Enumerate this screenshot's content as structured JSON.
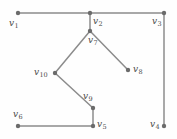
{
  "figure": {
    "type": "undirected-graph-diagram",
    "background_color": "#fefefe",
    "edge_color": "#8c8c8c",
    "vertex_color": "#6b6b6b",
    "label_color": "#4a4a4a",
    "width": 177,
    "height": 139
  },
  "vertices": [
    {
      "id": "v1",
      "label": "v",
      "sub": "1",
      "x": 18,
      "y": 13,
      "label_x": 9,
      "label_y": 19,
      "r": 2.2
    },
    {
      "id": "v2",
      "label": "v",
      "sub": "2",
      "x": 90,
      "y": 13,
      "label_x": 93,
      "label_y": 17,
      "r": 2.2
    },
    {
      "id": "v3",
      "label": "v",
      "sub": "3",
      "x": 164,
      "y": 13,
      "label_x": 152,
      "label_y": 17,
      "r": 2.2
    },
    {
      "id": "v4",
      "label": "v",
      "sub": "4",
      "x": 164,
      "y": 126,
      "label_x": 150,
      "label_y": 120,
      "r": 2.2
    },
    {
      "id": "v5",
      "label": "v",
      "sub": "5",
      "x": 93,
      "y": 126,
      "label_x": 97,
      "label_y": 120,
      "r": 2.2
    },
    {
      "id": "v6",
      "label": "v",
      "sub": "6",
      "x": 18,
      "y": 126,
      "label_x": 13,
      "label_y": 110,
      "r": 2.2
    },
    {
      "id": "v7",
      "label": "v",
      "sub": "7",
      "x": 90,
      "y": 31,
      "label_x": 88,
      "label_y": 36,
      "r": 2.2
    },
    {
      "id": "v8",
      "label": "v",
      "sub": "8",
      "x": 128,
      "y": 70,
      "label_x": 133,
      "label_y": 65,
      "r": 2.2
    },
    {
      "id": "v9",
      "label": "v",
      "sub": "9",
      "x": 93,
      "y": 108,
      "label_x": 83,
      "label_y": 92,
      "r": 2.2
    },
    {
      "id": "v10",
      "label": "v",
      "sub": "10",
      "x": 55,
      "y": 73,
      "label_x": 34,
      "label_y": 68,
      "r": 2.2
    }
  ],
  "edges": [
    {
      "from": "v1",
      "to": "v2"
    },
    {
      "from": "v2",
      "to": "v3"
    },
    {
      "from": "v2",
      "to": "v7"
    },
    {
      "from": "v3",
      "to": "v4"
    },
    {
      "from": "v7",
      "to": "v8"
    },
    {
      "from": "v7",
      "to": "v10"
    },
    {
      "from": "v10",
      "to": "v9"
    },
    {
      "from": "v9",
      "to": "v5"
    },
    {
      "from": "v5",
      "to": "v6"
    }
  ]
}
